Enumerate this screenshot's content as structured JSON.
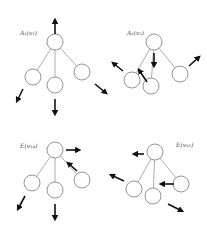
{
  "diagram": {
    "panels": [
      {
        "id": "top-left",
        "label": "A₁(v₁)",
        "label_pos": [
          20,
          35
        ],
        "root": [
          55,
          42
        ],
        "children": [
          [
            33,
            77
          ],
          [
            55,
            85
          ],
          [
            82,
            72
          ]
        ],
        "arrows": [
          [
            [
              55,
              34
            ],
            [
              55,
              20
            ]
          ],
          [
            [
              23,
              89
            ],
            [
              17,
              101
            ]
          ],
          [
            [
              55,
              99
            ],
            [
              55,
              114
            ]
          ],
          [
            [
              95,
              84
            ],
            [
              106,
              93
            ]
          ]
        ]
      },
      {
        "id": "top-right",
        "label": "A₁(v₂)",
        "label_pos": [
          127,
          35
        ],
        "root": [
          154,
          42
        ],
        "children": [
          [
            132,
            80
          ],
          [
            151,
            86
          ],
          [
            180,
            74
          ]
        ],
        "arrows": [
          [
            [
              123,
              71
            ],
            [
              113,
              63
            ]
          ],
          [
            [
              147,
              82
            ],
            [
              139,
              70
            ]
          ],
          [
            [
              154,
              53
            ],
            [
              154,
              66
            ]
          ],
          [
            [
              189,
              66
            ],
            [
              199,
              57
            ]
          ]
        ]
      },
      {
        "id": "bottom-left",
        "label": "E(v₁₄)",
        "label_pos": [
          20,
          148
        ],
        "root": [
          55,
          150
        ],
        "children": [
          [
            32,
            183
          ],
          [
            55,
            190
          ],
          [
            82,
            180
          ]
        ],
        "arrows": [
          [
            [
              66,
              150
            ],
            [
              79,
              150
            ]
          ],
          [
            [
              77,
              171
            ],
            [
              68,
              163
            ]
          ],
          [
            [
              25,
              196
            ],
            [
              18,
              209
            ]
          ],
          [
            [
              55,
              204
            ],
            [
              55,
              219
            ]
          ]
        ]
      },
      {
        "id": "bottom-right",
        "label": "E(v₁₆)",
        "label_pos": [
          176,
          147
        ],
        "root": [
          155,
          152
        ],
        "children": [
          [
            134,
            189
          ],
          [
            153,
            196
          ],
          [
            181,
            184
          ]
        ],
        "arrows": [
          [
            [
              144,
              154
            ],
            [
              134,
              154
            ]
          ],
          [
            [
              124,
              181
            ],
            [
              111,
              175
            ]
          ],
          [
            [
              174,
              184
            ],
            [
              161,
              184
            ]
          ],
          [
            [
              168,
              204
            ],
            [
              182,
              211
            ]
          ]
        ]
      }
    ],
    "node_radius": 8
  }
}
